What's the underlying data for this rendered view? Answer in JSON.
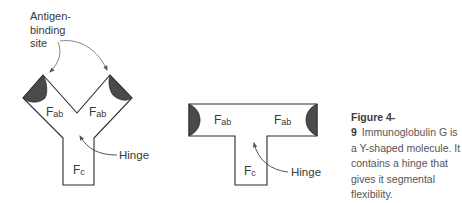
{
  "diagram": {
    "left_molecule": {
      "callout_label": [
        "Antigen-",
        "binding",
        "site"
      ],
      "fab_left": {
        "main": "F",
        "sub": "ab"
      },
      "fab_right": {
        "main": "F",
        "sub": "ab"
      },
      "fc": {
        "main": "F",
        "sub": "c"
      },
      "hinge_label": "Hinge"
    },
    "right_molecule": {
      "fab_left": {
        "main": "F",
        "sub": "ab"
      },
      "fab_right": {
        "main": "F",
        "sub": "ab"
      },
      "fc": {
        "main": "F",
        "sub": "c"
      },
      "hinge_label": "Hinge"
    },
    "colors": {
      "outline": "#2b2b2b",
      "binding_site_fill": "#4a4a4a",
      "arrow": "#6a6a6a",
      "text": "#3a3a3a"
    }
  },
  "caption": {
    "figure_number": "Figure 4-9",
    "text": "Immunoglobulin G is a Y-shaped molecule. It contains a hinge that gives it segmental flexibility."
  }
}
